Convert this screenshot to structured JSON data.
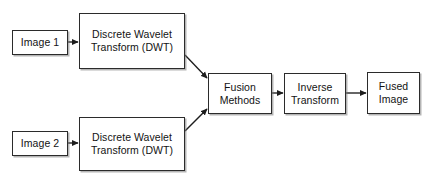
{
  "diagram": {
    "background_color": "#ffffff",
    "stroke_color": "#2b2b2b",
    "text_color": "#131313",
    "nodes": [
      {
        "id": "image-1",
        "label": "Image 1",
        "lines": [
          "Image 1"
        ],
        "x": 12,
        "y": 30,
        "w": 56,
        "h": 25
      },
      {
        "id": "dwt-top",
        "label": "Discrete Wavelet Transform (DWT)",
        "lines": [
          "Discrete Wavelet",
          "Transform (DWT)"
        ],
        "x": 79,
        "y": 13,
        "w": 106,
        "h": 56
      },
      {
        "id": "image-2",
        "label": "Image 2",
        "lines": [
          "Image 2"
        ],
        "x": 12,
        "y": 131,
        "w": 56,
        "h": 25
      },
      {
        "id": "dwt-bottom",
        "label": "Discrete Wavelet Transform (DWT)",
        "lines": [
          "Discrete Wavelet",
          "Transform (DWT)"
        ],
        "x": 79,
        "y": 117,
        "w": 106,
        "h": 54
      },
      {
        "id": "fusion-methods",
        "label": "Fusion Methods",
        "lines": [
          "Fusion",
          "Methods"
        ],
        "x": 208,
        "y": 73,
        "w": 64,
        "h": 41
      },
      {
        "id": "inverse-transform",
        "label": "Inverse Transform",
        "lines": [
          "Inverse",
          "Transform"
        ],
        "x": 284,
        "y": 73,
        "w": 62,
        "h": 41
      },
      {
        "id": "fused-image",
        "label": "Fused Image",
        "lines": [
          "Fused",
          "Image"
        ],
        "x": 367,
        "y": 72,
        "w": 53,
        "h": 42
      }
    ],
    "edges": [
      {
        "id": "edge-image1-to-dwt-top",
        "from": "image-1",
        "to": "dwt-top",
        "x1": 68,
        "y1": 42,
        "x2": 78,
        "y2": 42
      },
      {
        "id": "edge-dwt-top-to-fusion",
        "from": "dwt-top",
        "to": "fusion-methods",
        "x1": 185,
        "y1": 55,
        "x2": 207,
        "y2": 78
      },
      {
        "id": "edge-image2-to-dwt-bottom",
        "from": "image-2",
        "to": "dwt-bottom",
        "x1": 68,
        "y1": 143,
        "x2": 78,
        "y2": 143
      },
      {
        "id": "edge-dwt-bottom-to-fusion",
        "from": "dwt-bottom",
        "to": "fusion-methods",
        "x1": 185,
        "y1": 131,
        "x2": 207,
        "y2": 109
      },
      {
        "id": "edge-fusion-to-inverse",
        "from": "fusion-methods",
        "to": "inverse-transform",
        "x1": 272,
        "y1": 93,
        "x2": 283,
        "y2": 93
      },
      {
        "id": "edge-inverse-to-fused",
        "from": "inverse-transform",
        "to": "fused-image",
        "x1": 346,
        "y1": 93,
        "x2": 366,
        "y2": 93
      }
    ]
  }
}
